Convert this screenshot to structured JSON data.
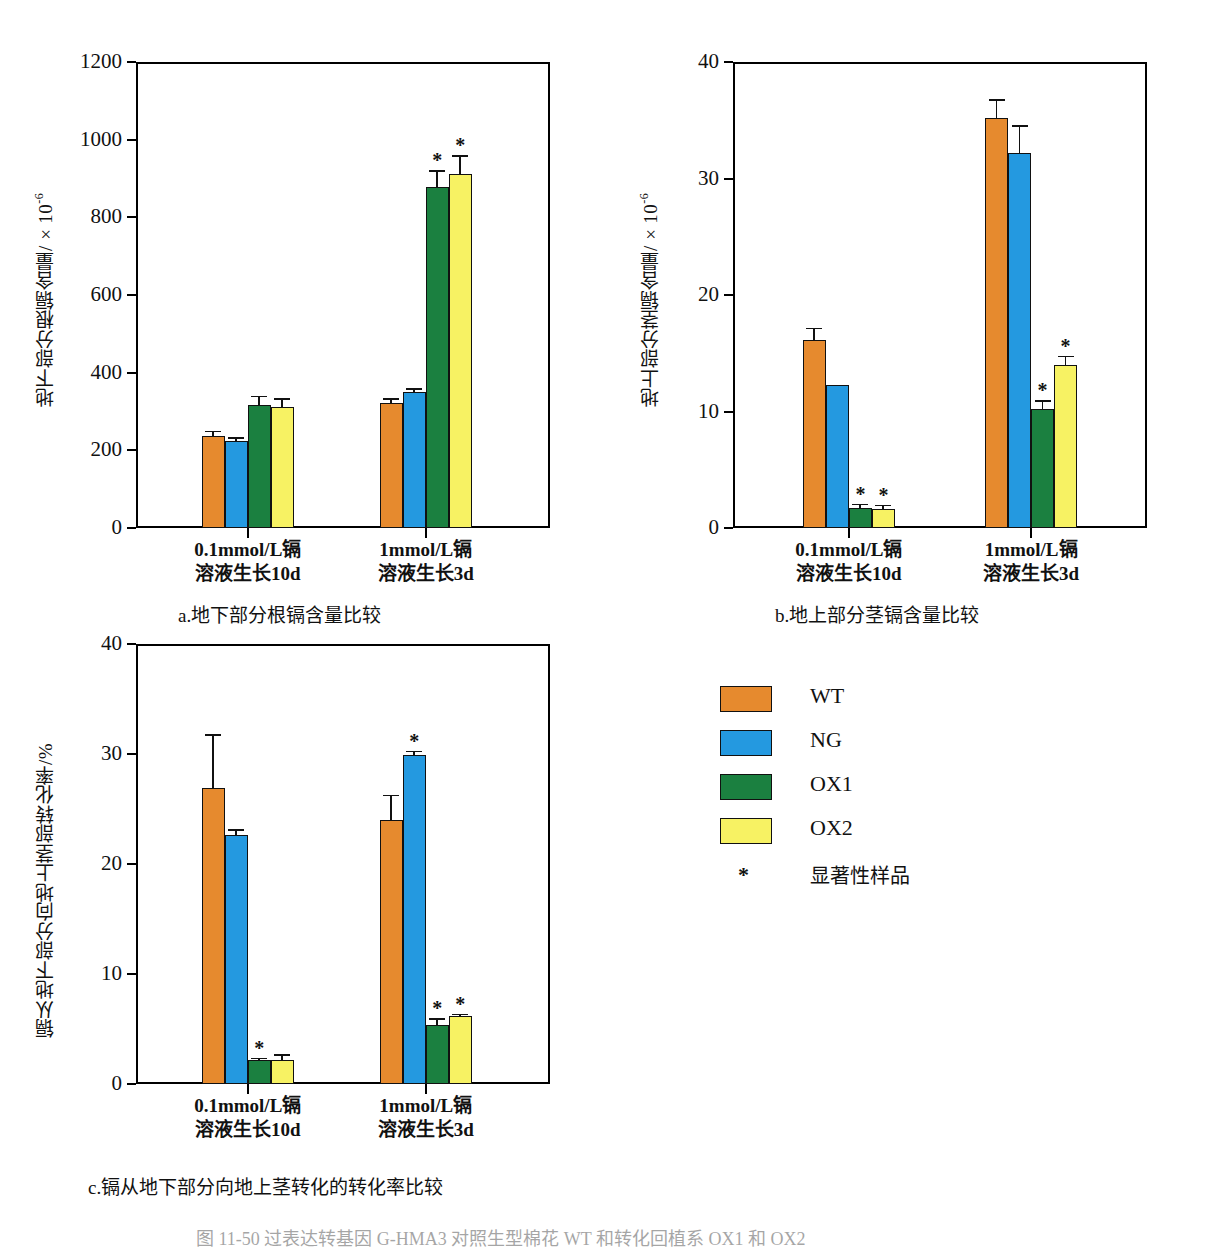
{
  "figure": {
    "caption_bottom": "图 11-50  过表达转基因 G-HMA3 对照生型棉花 WT 和转化回植系 OX1 和 OX2",
    "legend": {
      "entries": [
        {
          "label": "WT",
          "color": "#E68A2E"
        },
        {
          "label": "NG",
          "color": "#2499E0"
        },
        {
          "label": "OX1",
          "color": "#1B8040"
        },
        {
          "label": "OX2",
          "color": "#F7F263"
        }
      ],
      "significance_marker": "*",
      "significance_label": "显著性样品"
    },
    "categories": [
      {
        "line1": "0.1mmol/L镉",
        "line2": "溶液生长10d"
      },
      {
        "line1": "1mmol/L镉",
        "line2": "溶液生长3d"
      }
    ]
  },
  "chart_data": [
    {
      "id": "a",
      "type": "bar",
      "title": "a.地下部分根镉含量比较",
      "ylabel": "地下部分根镉含量/×10",
      "ylabel_exp": "-6",
      "xlabel": "",
      "ylim": [
        0,
        1200
      ],
      "yticks": [
        0,
        200,
        400,
        600,
        800,
        1000,
        1200
      ],
      "categories": [
        "0.1mmol/L镉 溶液生长10d",
        "1mmol/L镉 溶液生长3d"
      ],
      "series": [
        {
          "name": "WT",
          "color": "#E68A2E",
          "values": [
            237,
            321
          ],
          "errors": [
            14,
            14
          ],
          "significant": [
            false,
            false
          ]
        },
        {
          "name": "NG",
          "color": "#2499E0",
          "values": [
            224,
            349
          ],
          "errors": [
            10,
            11
          ],
          "significant": [
            false,
            false
          ]
        },
        {
          "name": "OX1",
          "color": "#1B8040",
          "values": [
            317,
            879
          ],
          "errors": [
            24,
            42
          ],
          "significant": [
            false,
            true
          ]
        },
        {
          "name": "OX2",
          "color": "#F7F263",
          "values": [
            312,
            911
          ],
          "errors": [
            22,
            50
          ],
          "significant": [
            false,
            true
          ]
        }
      ]
    },
    {
      "id": "b",
      "type": "bar",
      "title": "b.地上部分茎镉含量比较",
      "ylabel": "地上部分茎镉含量/×10",
      "ylabel_exp": "-6",
      "xlabel": "",
      "ylim": [
        0,
        40
      ],
      "yticks": [
        0,
        10,
        20,
        30,
        40
      ],
      "categories": [
        "0.1mmol/L镉 溶液生长10d",
        "1mmol/L镉 溶液生长3d"
      ],
      "series": [
        {
          "name": "WT",
          "color": "#E68A2E",
          "values": [
            16.1,
            35.2
          ],
          "errors": [
            1.1,
            1.6
          ],
          "significant": [
            false,
            false
          ]
        },
        {
          "name": "NG",
          "color": "#2499E0",
          "values": [
            12.3,
            32.2
          ],
          "errors": [
            0.0,
            2.4
          ],
          "significant": [
            false,
            false
          ]
        },
        {
          "name": "OX1",
          "color": "#1B8040",
          "values": [
            1.7,
            10.2
          ],
          "errors": [
            0.4,
            0.8
          ],
          "significant": [
            true,
            true
          ]
        },
        {
          "name": "OX2",
          "color": "#F7F263",
          "values": [
            1.6,
            14.0
          ],
          "errors": [
            0.4,
            0.8
          ],
          "significant": [
            true,
            true
          ]
        }
      ]
    },
    {
      "id": "c",
      "type": "bar",
      "title": "c.镉从地下部分向地上茎转化的转化率比较",
      "ylabel": "镉从地下部分向地上茎部转化率/%",
      "ylabel_exp": "",
      "xlabel": "",
      "ylim": [
        0,
        40
      ],
      "yticks": [
        0,
        10,
        20,
        30,
        40
      ],
      "categories": [
        "0.1mmol/L镉 溶液生长10d",
        "1mmol/L镉 溶液生长3d"
      ],
      "series": [
        {
          "name": "WT",
          "color": "#E68A2E",
          "values": [
            26.9,
            24.0
          ],
          "errors": [
            4.9,
            2.3
          ],
          "significant": [
            false,
            false
          ]
        },
        {
          "name": "NG",
          "color": "#2499E0",
          "values": [
            22.6,
            29.9
          ],
          "errors": [
            0.6,
            0.4
          ],
          "significant": [
            false,
            true
          ]
        },
        {
          "name": "OX1",
          "color": "#1B8040",
          "values": [
            2.2,
            5.4
          ],
          "errors": [
            0.2,
            0.6
          ],
          "significant": [
            true,
            true
          ]
        },
        {
          "name": "OX2",
          "color": "#F7F263",
          "values": [
            2.2,
            6.2
          ],
          "errors": [
            0.5,
            0.2
          ],
          "significant": [
            false,
            true
          ]
        }
      ]
    }
  ]
}
